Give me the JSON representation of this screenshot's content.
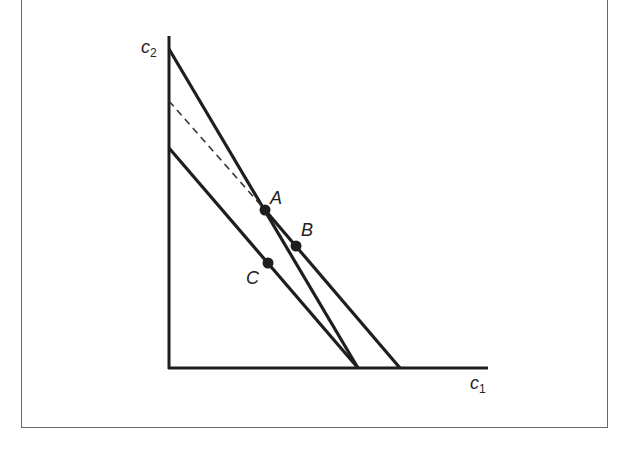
{
  "diagram": {
    "type": "budget-constraint",
    "axes": {
      "x_label": "c",
      "x_sub": "1",
      "y_label": "c",
      "y_sub": "2"
    },
    "points": [
      {
        "label": "A",
        "x": 265,
        "y": 210
      },
      {
        "label": "B",
        "x": 296,
        "y": 246
      },
      {
        "label": "C",
        "x": 268,
        "y": 263
      }
    ],
    "lines": [
      {
        "name": "steep-budget-line",
        "from": [
          169,
          49
        ],
        "to": [
          358,
          368
        ],
        "style": "solid"
      },
      {
        "name": "outer-budget-line-dashed",
        "from": [
          169,
          101
        ],
        "to": [
          265,
          210
        ],
        "style": "dashed"
      },
      {
        "name": "outer-budget-line",
        "from": [
          265,
          210
        ],
        "to": [
          400,
          368
        ],
        "style": "solid"
      },
      {
        "name": "inner-budget-line",
        "from": [
          169,
          148
        ],
        "to": [
          358,
          368
        ],
        "style": "solid"
      }
    ],
    "colors": {
      "line": "#1e1e1e",
      "frame": "#6a6a6a"
    }
  }
}
